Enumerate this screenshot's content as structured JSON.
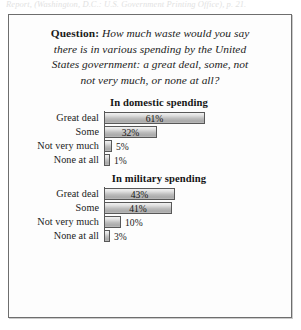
{
  "page": {
    "top_fragment": "Report, (Washington, D.C.: U.S. Government Printing Office), p. 21."
  },
  "question": {
    "lead": "Question:",
    "lines": [
      "How much waste would you say",
      "there is in various spending by the United",
      "States government: a great deal, some, not",
      "not very much, or none at all?"
    ]
  },
  "chart_data": [
    {
      "type": "bar",
      "orientation": "horizontal",
      "title": "In domestic spending",
      "categories": [
        "Great deal",
        "Some",
        "Not very much",
        "None at all"
      ],
      "values": [
        61,
        32,
        5,
        1
      ],
      "value_labels": [
        "61%",
        "32%",
        "5%",
        "1%"
      ],
      "xlabel": "",
      "ylabel": "",
      "xlim": [
        0,
        61
      ],
      "grid": false,
      "legend": false
    },
    {
      "type": "bar",
      "orientation": "horizontal",
      "title": "In military spending",
      "categories": [
        "Great deal",
        "Some",
        "Not very much",
        "None at all"
      ],
      "values": [
        43,
        41,
        10,
        3
      ],
      "value_labels": [
        "43%",
        "41%",
        "10%",
        "3%"
      ],
      "xlabel": "",
      "ylabel": "",
      "xlim": [
        0,
        61
      ],
      "grid": false,
      "legend": false
    }
  ],
  "style": {
    "bar_px_per_percent": 1.66,
    "bar_fill": "#bdbdbd",
    "bar_border": "#585858",
    "frame_border": "#6e6e6e",
    "text_color": "#1b1b1b"
  }
}
